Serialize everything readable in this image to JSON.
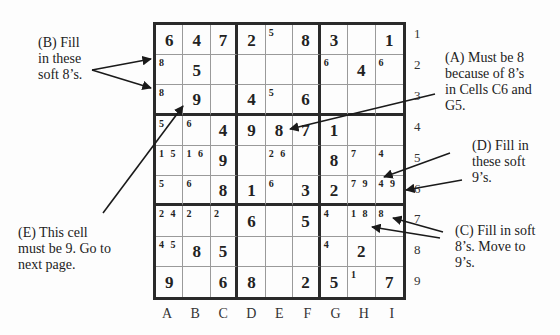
{
  "grid": {
    "columns": [
      "A",
      "B",
      "C",
      "D",
      "E",
      "F",
      "G",
      "H",
      "I"
    ],
    "rows": [
      "1",
      "2",
      "3",
      "4",
      "5",
      "6",
      "7",
      "8",
      "9"
    ],
    "cells": [
      [
        {
          "v": "6"
        },
        {
          "v": "4"
        },
        {
          "v": "7"
        },
        {
          "v": "2"
        },
        {
          "c": "5"
        },
        {
          "v": "8"
        },
        {
          "v": "3"
        },
        {},
        {
          "v": "1"
        }
      ],
      [
        {
          "c": "8"
        },
        {
          "v": "5"
        },
        {},
        {},
        {},
        {},
        {
          "c": "6"
        },
        {
          "v": "4"
        },
        {
          "c": "6"
        }
      ],
      [
        {
          "c": "8"
        },
        {
          "v": "9"
        },
        {},
        {
          "v": "4"
        },
        {
          "c": "5"
        },
        {
          "v": "6"
        },
        {},
        {},
        {}
      ],
      [
        {
          "c": "5"
        },
        {
          "c": "6"
        },
        {
          "v": "4"
        },
        {
          "v": "9"
        },
        {
          "v": "8"
        },
        {
          "v": "7"
        },
        {
          "v": "1"
        },
        {},
        {}
      ],
      [
        {
          "c": "1 5"
        },
        {
          "c": "1 6"
        },
        {
          "v": "9"
        },
        {},
        {
          "c": "2 6"
        },
        {},
        {
          "v": "8"
        },
        {
          "c": "7"
        },
        {
          "c": "4"
        }
      ],
      [
        {
          "c": "5"
        },
        {
          "c": "6"
        },
        {
          "v": "8"
        },
        {
          "v": "1"
        },
        {
          "c": "6"
        },
        {
          "v": "3"
        },
        {
          "v": "2"
        },
        {
          "c": "7 9"
        },
        {
          "c": "4 9"
        }
      ],
      [
        {
          "c": "2 4"
        },
        {
          "c": "2"
        },
        {
          "c": "2"
        },
        {
          "v": "6"
        },
        {},
        {
          "v": "5"
        },
        {
          "c": "4"
        },
        {
          "c": "1 8"
        },
        {
          "c": "8"
        }
      ],
      [
        {
          "c": "4 5"
        },
        {
          "v": "8"
        },
        {
          "v": "5"
        },
        {},
        {},
        {},
        {
          "c": "4"
        },
        {
          "v": "2"
        },
        {}
      ],
      [
        {
          "v": "9"
        },
        {},
        {
          "v": "6"
        },
        {
          "v": "8"
        },
        {},
        {
          "v": "2"
        },
        {
          "v": "5"
        },
        {
          "c": "1"
        },
        {
          "v": "7"
        }
      ]
    ]
  },
  "notes": {
    "A": [
      "(A) Must be 8",
      "because of 8’s",
      "in Cells C6 and",
      "G5."
    ],
    "B": [
      "(B) Fill",
      "in these",
      "soft 8’s."
    ],
    "C": [
      "(C) Fill in soft",
      "8’s. Move to",
      "9’s."
    ],
    "D": [
      "(D) Fill in",
      "these soft",
      "9’s."
    ],
    "E": [
      "(E) This cell",
      "must be 9. Go to",
      "next page."
    ]
  }
}
